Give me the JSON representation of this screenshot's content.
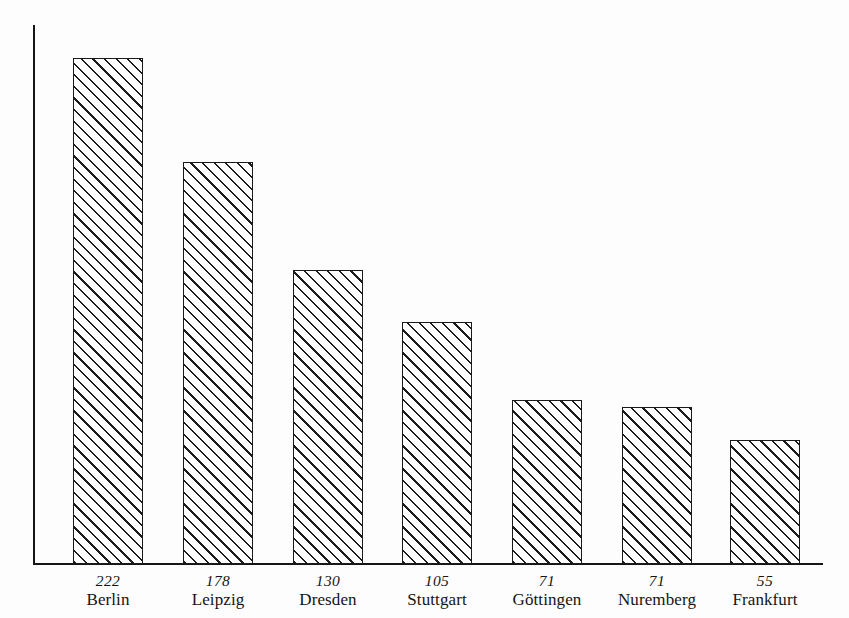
{
  "chart_data": {
    "type": "bar",
    "title": "",
    "subtitle": "",
    "xlabel": "",
    "ylabel": "",
    "categories": [
      "Berlin",
      "Leipzig",
      "Dresden",
      "Stuttgart",
      "Göttingen",
      "Nuremberg",
      "Frankfurt"
    ],
    "values": [
      222,
      178,
      130,
      105,
      71,
      71,
      55
    ],
    "value_labels": [
      "222",
      "178",
      "130",
      "105",
      "71",
      "71",
      "55"
    ],
    "ylim": [
      0,
      246
    ],
    "grid": false,
    "legend": null,
    "legend_position": "none",
    "annotations": [],
    "axis_style": {
      "y_axis_visible": true,
      "x_axis_visible": true,
      "y_ticks": [],
      "x_tick_labels_two_line": true
    },
    "bar_style": {
      "fill": "#ffffff",
      "edge_color": "#1a1a1a",
      "hatch": "diagonal-45-up-right",
      "hatch_spacing_px": 8
    }
  },
  "colors": {
    "background": "#fdfdfd",
    "ink": "#141414",
    "axis": "#161616",
    "bar_edge": "#1a1a1a",
    "bar_fill": "#ffffff",
    "hatch": "#1c1c1c"
  },
  "bars": [
    {
      "value": 222,
      "value_label": "222",
      "category": "Berlin",
      "x": 73,
      "width": 70,
      "top": 58,
      "height": 506
    },
    {
      "value": 178,
      "value_label": "178",
      "category": "Leipzig",
      "x": 183,
      "width": 70,
      "top": 162,
      "height": 402
    },
    {
      "value": 130,
      "value_label": "130",
      "category": "Dresden",
      "x": 293,
      "width": 70,
      "top": 270,
      "height": 294
    },
    {
      "value": 105,
      "value_label": "105",
      "category": "Stuttgart",
      "x": 402,
      "width": 70,
      "top": 322,
      "height": 242
    },
    {
      "value": 71,
      "value_label": "71",
      "category": "Göttingen",
      "x": 512,
      "width": 70,
      "top": 400,
      "height": 164
    },
    {
      "value": 71,
      "value_label": "71",
      "category": "Nuremberg",
      "x": 622,
      "width": 70,
      "top": 407,
      "height": 157
    },
    {
      "value": 55,
      "value_label": "55",
      "category": "Frankfurt",
      "x": 730,
      "width": 70,
      "top": 440,
      "height": 124
    }
  ]
}
